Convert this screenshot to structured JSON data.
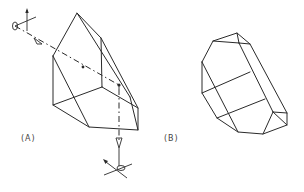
{
  "figure": {
    "panels": [
      {
        "id": "A",
        "label": "(A)",
        "description": "Crystal with light ray path, polarizer and analyzer"
      },
      {
        "id": "B",
        "label": "(B)",
        "description": "Prismatic crystal habit"
      }
    ],
    "colors": {
      "line": "#2a2a2a",
      "background": "#ffffff",
      "label": "#444444"
    }
  }
}
